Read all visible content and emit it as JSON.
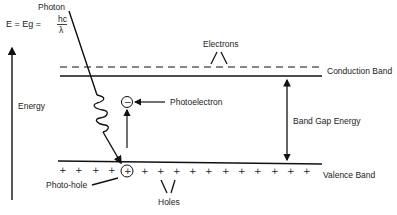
{
  "diagram": {
    "title_formula": {
      "lhs": "E = Eg =",
      "numerator": "hc",
      "denominator": "λ"
    },
    "labels": {
      "photon": "Photon",
      "electrons": "Electrons",
      "conduction_band": "Conduction Band",
      "energy": "Energy",
      "photoelectron": "Photoelectron",
      "band_gap_energy": "Band Gap Energy",
      "valence_band": "Valence Band",
      "photo_hole": "Photo-hole",
      "holes": "Holes"
    },
    "symbols": {
      "electron": "−",
      "hole": "+"
    },
    "colors": {
      "line": "#111111",
      "text": "#222222",
      "background": "#ffffff"
    }
  }
}
